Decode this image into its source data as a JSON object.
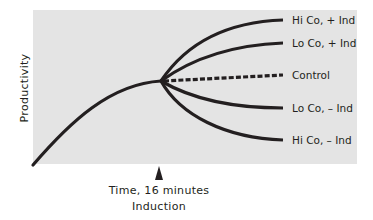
{
  "diagram": {
    "y_axis_label": "Productivity",
    "x_axis_label": "Time, 16 minutes",
    "event_label": "Induction",
    "colors": {
      "background": "#e4e4e4",
      "line": "#231f20"
    },
    "series": [
      {
        "label": "Hi Co, + Ind",
        "style": "solid",
        "end_y": 20
      },
      {
        "label": "Lo Co, + Ind",
        "style": "solid",
        "end_y": 43
      },
      {
        "label": "Control",
        "style": "dashed",
        "end_y": 75
      },
      {
        "label": "Lo Co, – Ind",
        "style": "solid",
        "end_y": 108
      },
      {
        "label": "Hi Co, – Ind",
        "style": "solid",
        "end_y": 140
      }
    ]
  }
}
